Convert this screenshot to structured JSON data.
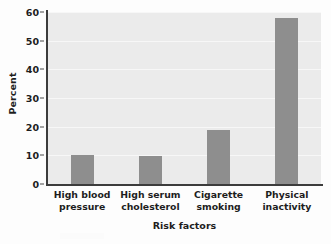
{
  "chart_data": {
    "type": "bar",
    "title": "",
    "categories": [
      "High blood pressure",
      "High serum cholesterol",
      "Cigarette smoking",
      "Physical inactivity"
    ],
    "category_lines": [
      [
        "High blood",
        "pressure"
      ],
      [
        "High serum",
        "cholesterol"
      ],
      [
        "Cigarette",
        "smoking"
      ],
      [
        "Physical",
        "inactivity"
      ]
    ],
    "values": [
      10,
      9.6,
      19,
      58
    ],
    "xlabel": "Risk factors",
    "ylabel": "Percent",
    "ylim": [
      0,
      60
    ],
    "yticks": [
      0,
      10,
      20,
      30,
      40,
      50,
      60
    ],
    "ytick_labels": [
      "0",
      "10",
      "20",
      "30",
      "40",
      "50",
      "60"
    ],
    "grid": true,
    "legend": false,
    "colors": {
      "bar": "#8e8e8e",
      "plot_background": "#ebebeb",
      "page_background": "#fdfdfd",
      "axis": "#3c3c3c",
      "gridline": "#f7f7f7",
      "text": "#1d1d1d"
    }
  }
}
